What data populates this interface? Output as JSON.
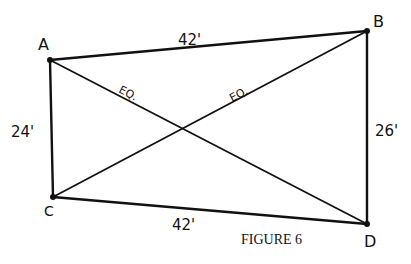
{
  "figure": {
    "caption": "FIGURE 6",
    "ink_color": "#111111",
    "background": "#ffffff"
  },
  "points": {
    "A": {
      "label": "A",
      "x": 50,
      "y": 60
    },
    "B": {
      "label": "B",
      "x": 367,
      "y": 31
    },
    "C": {
      "label": "C",
      "x": 53,
      "y": 197
    },
    "D": {
      "label": "D",
      "x": 367,
      "y": 224
    }
  },
  "sides": {
    "AB": {
      "label": "42'"
    },
    "AC": {
      "label": "24'"
    },
    "BD": {
      "label": "26'"
    },
    "CD": {
      "label": "42'"
    }
  },
  "diagonals": {
    "AD": {
      "label": "EQ."
    },
    "CB": {
      "label": "EQ."
    }
  }
}
